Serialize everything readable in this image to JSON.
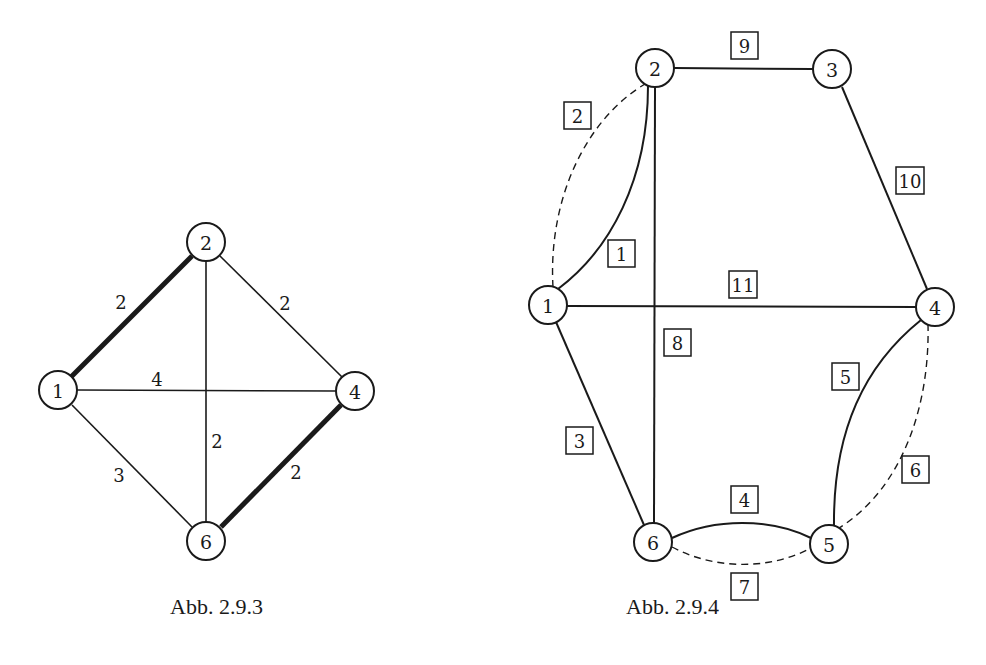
{
  "figures": [
    {
      "caption": "Abb. 2.9.3",
      "nodes": [
        {
          "id": "1",
          "label": "1",
          "x": 58,
          "y": 390
        },
        {
          "id": "2",
          "label": "2",
          "x": 206,
          "y": 242
        },
        {
          "id": "4",
          "label": "4",
          "x": 355,
          "y": 391
        },
        {
          "id": "6",
          "label": "6",
          "x": 206,
          "y": 541
        }
      ],
      "edges": [
        {
          "from": "1",
          "to": "2",
          "weight": "2",
          "bold": true
        },
        {
          "from": "2",
          "to": "4",
          "weight": "2",
          "bold": false
        },
        {
          "from": "1",
          "to": "4",
          "weight": "4",
          "bold": false
        },
        {
          "from": "2",
          "to": "6",
          "weight": "2",
          "bold": false
        },
        {
          "from": "1",
          "to": "6",
          "weight": "3",
          "bold": false
        },
        {
          "from": "4",
          "to": "6",
          "weight": "2",
          "bold": true
        }
      ],
      "edge_labels": {
        "e12": "2",
        "e24": "2",
        "e14": "4",
        "e26": "2",
        "e16": "3",
        "e46": "2"
      }
    },
    {
      "caption": "Abb. 2.9.4",
      "nodes": [
        {
          "id": "1",
          "label": "1",
          "x": 548,
          "y": 305
        },
        {
          "id": "2",
          "label": "2",
          "x": 655,
          "y": 68
        },
        {
          "id": "3",
          "label": "3",
          "x": 832,
          "y": 69
        },
        {
          "id": "4",
          "label": "4",
          "x": 935,
          "y": 307
        },
        {
          "id": "5",
          "label": "5",
          "x": 829,
          "y": 544
        },
        {
          "id": "6",
          "label": "6",
          "x": 653,
          "y": 542
        }
      ],
      "edges": [
        {
          "from": "1",
          "to": "2",
          "label": "1",
          "style": "solid-curve"
        },
        {
          "from": "1",
          "to": "2",
          "label": "2",
          "style": "dashed-curve"
        },
        {
          "from": "1",
          "to": "6",
          "label": "3",
          "style": "solid"
        },
        {
          "from": "6",
          "to": "5",
          "label": "4",
          "style": "solid-curve"
        },
        {
          "from": "4",
          "to": "5",
          "label": "5",
          "style": "solid-curve"
        },
        {
          "from": "4",
          "to": "5",
          "label": "6",
          "style": "dashed-curve"
        },
        {
          "from": "6",
          "to": "5",
          "label": "7",
          "style": "dashed-curve"
        },
        {
          "from": "2",
          "to": "6",
          "label": "8",
          "style": "solid"
        },
        {
          "from": "2",
          "to": "3",
          "label": "9",
          "style": "solid"
        },
        {
          "from": "3",
          "to": "4",
          "label": "10",
          "style": "solid"
        },
        {
          "from": "1",
          "to": "4",
          "label": "11",
          "style": "solid"
        }
      ],
      "edge_labels": {
        "b1": "1",
        "b2": "2",
        "b3": "3",
        "b4": "4",
        "b5": "5",
        "b6": "6",
        "b7": "7",
        "b8": "8",
        "b9": "9",
        "b10": "10",
        "b11": "11"
      }
    }
  ],
  "fig1": {
    "caption": "Abb. 2.9.3",
    "n1": "1",
    "n2": "2",
    "n4": "4",
    "n6": "6"
  },
  "fig2": {
    "caption": "Abb. 2.9.4",
    "n1": "1",
    "n2": "2",
    "n3": "3",
    "n4": "4",
    "n5": "5",
    "n6": "6"
  }
}
